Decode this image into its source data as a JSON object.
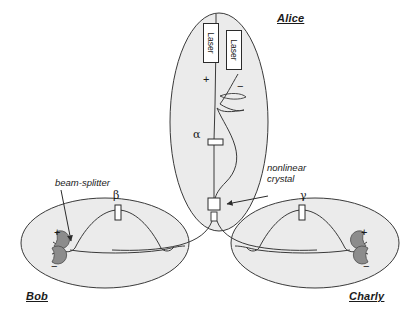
{
  "figure": {
    "title_alt": "Three-party quantum entanglement distribution schematic",
    "background": "#ffffff",
    "ellipse_fill": "#ebebeb",
    "stroke": "#3a3a3a",
    "detector_fill": "#8c8c8c"
  },
  "parties": {
    "alice": {
      "label": "Alice"
    },
    "bob": {
      "label": "Bob"
    },
    "charly": {
      "label": "Charly"
    }
  },
  "alice": {
    "laser1": "Laser",
    "laser2": "Laser",
    "plus": "+",
    "minus": "−",
    "phase_symbol": "α",
    "crystal_label_line1": "nonlinear",
    "crystal_label_line2": "crystal"
  },
  "bob": {
    "phase_symbol": "β",
    "plus": "+",
    "minus": "−",
    "beamsplitter_label": "beam-splitter"
  },
  "charly": {
    "phase_symbol": "γ",
    "plus": "+",
    "minus": "−"
  }
}
